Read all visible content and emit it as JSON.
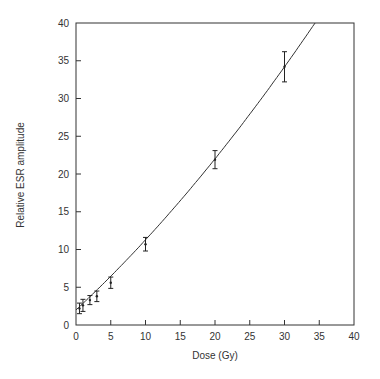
{
  "chart_data": {
    "type": "scatter",
    "title": "",
    "xlabel": "Dose (Gy)",
    "ylabel": "Relative ESR amplitude",
    "xlim": [
      0,
      40
    ],
    "ylim": [
      0,
      40
    ],
    "xticks": [
      0,
      5,
      10,
      15,
      20,
      25,
      30,
      35,
      40
    ],
    "yticks": [
      0,
      5,
      10,
      15,
      20,
      25,
      30,
      35,
      40
    ],
    "grid": false,
    "legend": null,
    "series": [
      {
        "name": "measured",
        "kind": "points_with_error_bars",
        "x": [
          0.5,
          1,
          2,
          3,
          5,
          10,
          20,
          30
        ],
        "y": [
          2.2,
          2.6,
          3.3,
          3.8,
          5.6,
          10.7,
          21.9,
          34.2
        ],
        "yerr": [
          0.7,
          0.8,
          0.6,
          0.7,
          0.75,
          0.9,
          1.2,
          2.0
        ]
      },
      {
        "name": "fit",
        "kind": "line",
        "x": [
          0,
          5,
          10,
          15,
          20,
          25,
          30,
          34.4
        ],
        "y": [
          2.0,
          6.5,
          11.3,
          16.5,
          22.0,
          27.3,
          33.4,
          40.0
        ]
      }
    ]
  },
  "colors": {
    "axis": "#333333",
    "line": "#333333",
    "points": "#222222",
    "background": "#ffffff"
  }
}
